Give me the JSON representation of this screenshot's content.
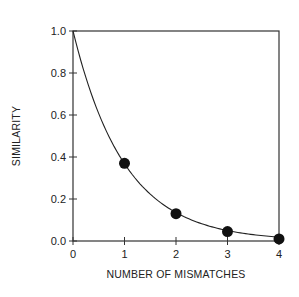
{
  "chart_data": {
    "type": "scatter",
    "title": "",
    "xlabel": "NUMBER OF MISMATCHES",
    "ylabel": "SIMILARITY",
    "xlim": [
      0,
      4
    ],
    "ylim": [
      0,
      1.0
    ],
    "x_ticks": [
      "0",
      "1",
      "2",
      "3",
      "4"
    ],
    "y_ticks": [
      "0.0",
      "0.2",
      "0.4",
      "0.6",
      "0.8",
      "1.0"
    ],
    "grid": false,
    "legend": null,
    "series": [
      {
        "name": "points",
        "type": "scatter",
        "x": [
          1,
          2,
          3,
          4
        ],
        "y": [
          0.37,
          0.13,
          0.045,
          0.01
        ]
      },
      {
        "name": "fit curve",
        "type": "line",
        "formula": "exp(-x)",
        "x": [
          0,
          0.5,
          1,
          1.5,
          2,
          2.5,
          3,
          3.5,
          4
        ],
        "y": [
          1.0,
          0.61,
          0.37,
          0.22,
          0.135,
          0.082,
          0.05,
          0.03,
          0.018
        ]
      }
    ]
  }
}
